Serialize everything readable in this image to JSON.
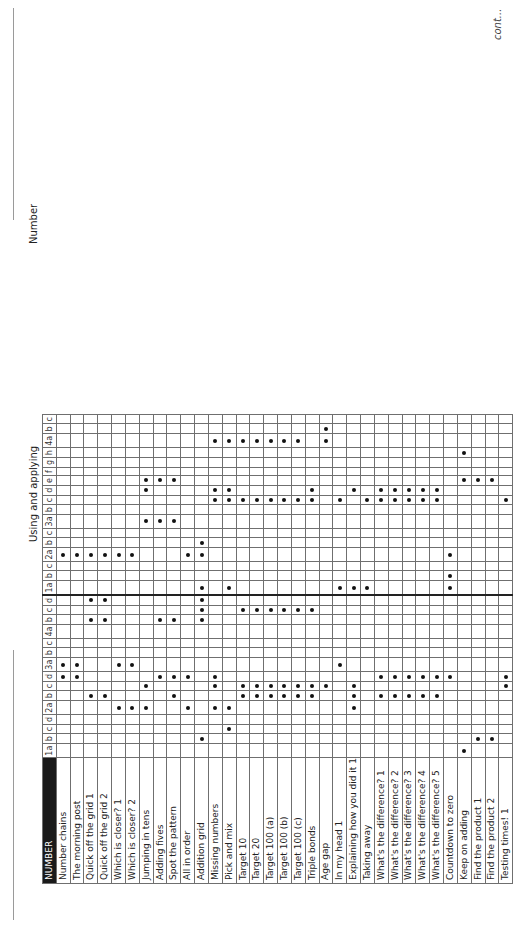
{
  "page": {
    "group_titles": {
      "using_applying": "Using and applying",
      "number": "Number"
    },
    "corner_label": "NUMBER",
    "continuation_note": "cont..."
  },
  "columns": {
    "using_applying": [
      "1a",
      "b",
      "c",
      "d",
      "2a",
      "b",
      "c",
      "d",
      "3a",
      "b",
      "c",
      "4a",
      "b",
      "c",
      "d"
    ],
    "number": [
      "1a",
      "b",
      "c",
      "2a",
      "b",
      "c",
      "3a",
      "b",
      "c",
      "d",
      "e",
      "f",
      "g",
      "h",
      "4a",
      "b",
      "c"
    ]
  },
  "rows": [
    "Number chains",
    "The morning post",
    "Quick off the grid 1",
    "Quick off the grid 2",
    "Which is closer? 1",
    "Which is closer? 2",
    "Jumping in tens",
    "Adding fives",
    "Spot the pattern",
    "All in order",
    "Addition grid",
    "Missing numbers",
    "Pick and mix",
    "Target 10",
    "Target 20",
    "Target 100 (a)",
    "Target 100 (b)",
    "Target 100 (c)",
    "Triple bonds",
    "Age gap",
    "In my head 1",
    "Explaining how you did it 1",
    "Taking away",
    "What's the difference? 1",
    "What's the difference? 2",
    "What's the difference? 3",
    "What's the difference? 4",
    "What's the difference? 5",
    "Countdown to zero",
    "Keep on adding",
    "Find the product 1",
    "Find the product 2",
    "Testing times! 1"
  ],
  "marks": {
    "using_applying": [
      [
        29
      ],
      [
        10,
        30,
        31
      ],
      [
        12
      ],
      [],
      [
        4,
        5,
        6,
        9,
        11,
        12,
        21
      ],
      [
        2,
        3,
        8,
        13,
        14,
        15,
        16,
        17,
        18,
        21,
        23,
        24,
        25,
        26,
        27
      ],
      [
        6,
        11,
        13,
        14,
        15,
        16,
        17,
        18,
        19,
        21,
        32
      ],
      [
        0,
        1,
        7,
        8,
        9,
        11,
        23,
        24,
        25,
        26,
        27,
        28,
        32
      ],
      [
        0,
        1,
        4,
        5,
        20
      ],
      [],
      [],
      [],
      [
        2,
        3,
        7,
        8,
        10
      ],
      [
        10,
        13,
        14,
        15,
        16,
        17,
        18
      ],
      [
        2,
        3,
        10
      ]
    ],
    "number": [
      [
        10,
        12,
        20,
        21,
        22,
        28
      ],
      [
        28
      ],
      [],
      [
        0,
        1,
        2,
        3,
        4,
        5,
        9,
        10,
        28
      ],
      [
        10
      ],
      [],
      [
        6,
        7,
        8
      ],
      [],
      [
        11,
        12,
        13,
        14,
        15,
        16,
        17,
        18,
        20,
        22,
        23,
        24,
        25,
        26,
        27,
        32
      ],
      [
        6,
        11,
        12,
        18,
        21,
        23,
        24,
        25,
        26,
        27
      ],
      [
        6,
        7,
        8,
        29,
        30,
        31
      ],
      [],
      [],
      [
        29
      ],
      [
        11,
        12,
        13,
        14,
        15,
        16,
        17,
        19
      ],
      [
        19
      ],
      []
    ]
  },
  "colors": {
    "header_bg": "#1a1a1a",
    "header_text": "#ffffff",
    "grid": "#6f6f6f",
    "dot": "#111111"
  }
}
